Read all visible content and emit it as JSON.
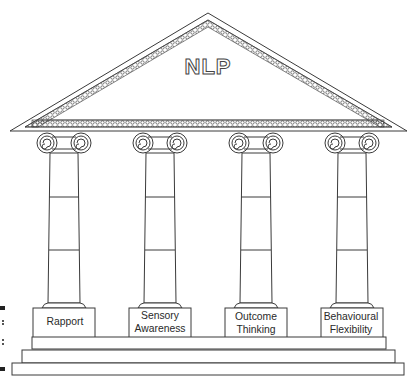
{
  "diagram": {
    "title": "NLP",
    "structure": "Greek temple: pediment (roof) supported by four Ionic columns standing on a three-step base",
    "pillars": [
      {
        "label_line1": "Rapport",
        "label_line2": ""
      },
      {
        "label_line1": "Sensory",
        "label_line2": "Awareness"
      },
      {
        "label_line1": "Outcome",
        "label_line2": "Thinking"
      },
      {
        "label_line1": "Behavioural",
        "label_line2": "Flexibility"
      }
    ],
    "colors": {
      "line": "#3a3a3a",
      "background": "#ffffff",
      "margin_marks": "#222222"
    }
  }
}
